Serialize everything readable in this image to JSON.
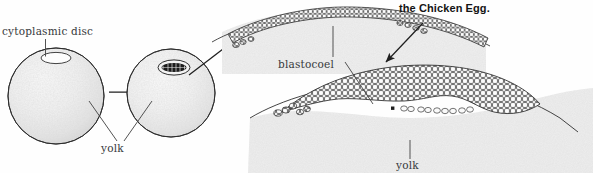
{
  "title": "the Chicken Egg.",
  "labels": {
    "cytoplasmic_disc": "cytoplasmic disc",
    "yolk_left": "yolk",
    "blastocoel": "blastocoel",
    "yolk_right": "yolk"
  },
  "colors": {
    "ink": "#37393c",
    "outline": "#2b2b2b",
    "title": "#141414",
    "background": "#fefefe",
    "yolk_fill_light": "#f2f2f2",
    "yolk_fill_mid": "#dcdcdc",
    "yolk_granular": "#d6d6d6",
    "cell_outline": "#3a3a3a",
    "blastodisc_dark": "#1a1a1a"
  },
  "diagram": {
    "type": "biological-development-diagram",
    "stages": [
      {
        "name": "unfertilized-ovum",
        "description": "yolk sphere with cytoplasmic disc at top",
        "cx": 56,
        "cy": 96,
        "r": 48,
        "disc": {
          "cx": 56,
          "cy": 58,
          "rx": 15,
          "ry": 5.5,
          "state": "clear"
        }
      },
      {
        "name": "cleaving-ovum",
        "description": "yolk sphere with cleaved cellular blastodisc",
        "cx": 171,
        "cy": 93,
        "r": 44,
        "disc": {
          "cx": 174,
          "cy": 67,
          "rx": 16,
          "ry": 7.5,
          "state": "cellular"
        }
      },
      {
        "name": "early-blastoderm",
        "description": "thin multilayer blastoderm arching over yolk mass",
        "layers": 2
      },
      {
        "name": "late-blastoderm",
        "description": "thick blastoderm enclosing blastocoel cavity above yolk",
        "layers": 5
      }
    ],
    "arrows": [
      {
        "name": "ovum-to-cleaving",
        "from": [
          109,
          92
        ],
        "to": [
          147,
          92
        ],
        "orientation": "horizontal-right"
      },
      {
        "name": "cleaving-to-blastoderm",
        "from": [
          189,
          74
        ],
        "to": [
          253,
          26
        ],
        "orientation": "diagonal-up-right"
      },
      {
        "name": "blastoderm-to-late-blastoderm",
        "from": [
          420,
          22
        ],
        "to": [
          385,
          63
        ],
        "orientation": "diagonal-down-left"
      }
    ],
    "leaders": [
      {
        "name": "cytoplasmic-disc-leader",
        "label": "cytoplasmic disc",
        "path": "vertical"
      },
      {
        "name": "yolk-left-leader",
        "label": "yolk",
        "path": "v-shaped-double"
      },
      {
        "name": "blastocoel-leader-upper",
        "label": "blastocoel",
        "path": "vertical"
      },
      {
        "name": "blastocoel-leader-lower",
        "label": "blastocoel",
        "path": "diagonal"
      },
      {
        "name": "yolk-right-leader",
        "label": "yolk",
        "path": "vertical"
      }
    ]
  }
}
